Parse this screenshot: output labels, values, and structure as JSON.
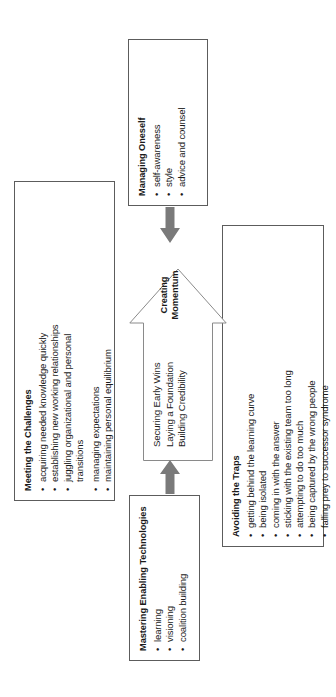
{
  "diagram": {
    "type": "business-framework-diagram",
    "orientation": "rotated-90-ccw",
    "colors": {
      "box_border": "#5c5c5c",
      "arrow_outline": "#8a8a8a",
      "connector_fill": "#7a7a7a",
      "text": "#1a1a1a",
      "background": "#ffffff"
    },
    "center": {
      "label_line1": "Creating",
      "label_line2": "Momentum",
      "items": [
        "Securing Early Wins",
        "Laying a Foundation",
        "Building Credibility"
      ]
    },
    "panels": {
      "challenges": {
        "title": "Meeting the Challenges",
        "bullets": [
          {
            "bullet": "•",
            "text": "acquiring needed knowledge quickly"
          },
          {
            "bullet": "•",
            "text": "establishing new working relationships"
          },
          {
            "bullet": "•",
            "text": "juggling organizational and personal"
          },
          {
            "bullet": "",
            "text": "transitions"
          },
          {
            "bullet": "•",
            "text": "managing expectations"
          },
          {
            "bullet": "•",
            "text": "maintaining personal equilibrium"
          }
        ]
      },
      "technologies": {
        "title": "Mastering Enabling Technologies",
        "bullets": [
          {
            "bullet": "•",
            "text": "learning"
          },
          {
            "bullet": "•",
            "text": "visioning"
          },
          {
            "bullet": "•",
            "text": "coalition building"
          }
        ]
      },
      "oneself": {
        "title": "Managing Oneself",
        "bullets": [
          {
            "bullet": "•",
            "text": "self-awareness"
          },
          {
            "bullet": "•",
            "text": "style"
          },
          {
            "bullet": "•",
            "text": "advice and counsel"
          }
        ]
      },
      "traps": {
        "title": "Avoiding the Traps",
        "bullets": [
          {
            "bullet": "•",
            "text": "getting behind the learning curve"
          },
          {
            "bullet": "•",
            "text": "being isolated"
          },
          {
            "bullet": "•",
            "text": "coming in with the answer"
          },
          {
            "bullet": "•",
            "text": "sticking with the existing team too long"
          },
          {
            "bullet": "•",
            "text": "attempting to do too much"
          },
          {
            "bullet": "•",
            "text": "being captured by the wrong people"
          },
          {
            "bullet": "•",
            "text": "falling prey to successor syndrome"
          }
        ]
      }
    },
    "connectors": [
      {
        "name": "technologies-to-center",
        "direction": "right"
      },
      {
        "name": "oneself-to-center",
        "direction": "left"
      }
    ]
  }
}
